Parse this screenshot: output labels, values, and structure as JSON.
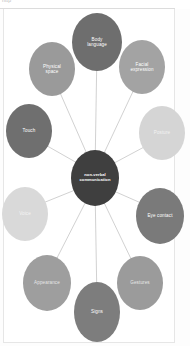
{
  "header": {
    "crumb_text": "http"
  },
  "diagram": {
    "center": {
      "label": "non-verbal\ncommunication",
      "label_line1": "non-verbal",
      "label_line2": "communication",
      "color": "#3f3f3f",
      "text_color": "#ffffff"
    },
    "edge_color": "#bdbdbd",
    "background": "#ffffff",
    "nodes": [
      {
        "id": "body-language",
        "label": "Body\nlanguage",
        "line1": "Body",
        "line2": "language",
        "color": "#6e6e6e",
        "text_color": "#ffffff",
        "cx": 97,
        "cy": 42,
        "rx": 25,
        "ry": 29,
        "angle_deg": 270
      },
      {
        "id": "facial-expression",
        "label": "Facial\nexpression",
        "line1": "Facial",
        "line2": "expression",
        "color": "#a3a3a3",
        "text_color": "#ffffff",
        "cx": 142,
        "cy": 67,
        "rx": 23,
        "ry": 27,
        "angle_deg": 315
      },
      {
        "id": "posture",
        "label": "Posture",
        "line1": "Posture",
        "line2": "",
        "color": "#d5d5d5",
        "text_color": "#f2f2f2",
        "cx": 162,
        "cy": 133,
        "rx": 23,
        "ry": 27,
        "angle_deg": 0
      },
      {
        "id": "eye-contact",
        "label": "Eye contact",
        "line1": "Eye contact",
        "line2": "",
        "color": "#7a7a7a",
        "text_color": "#ffffff",
        "cx": 160,
        "cy": 216,
        "rx": 24,
        "ry": 28,
        "angle_deg": 45
      },
      {
        "id": "gestures",
        "label": "Gestures",
        "line1": "Gestures",
        "line2": "",
        "color": "#9b9b9b",
        "text_color": "#e8e8e8",
        "cx": 140,
        "cy": 283,
        "rx": 23,
        "ry": 27,
        "angle_deg": 70
      },
      {
        "id": "signs",
        "label": "Signs",
        "line1": "Signs",
        "line2": "",
        "color": "#7d7d7d",
        "text_color": "#ffffff",
        "cx": 97,
        "cy": 312,
        "rx": 23,
        "ry": 30,
        "angle_deg": 90
      },
      {
        "id": "appearance",
        "label": "Appearance",
        "line1": "Appearance",
        "line2": "",
        "color": "#9e9e9e",
        "text_color": "#e6e6e6",
        "cx": 47,
        "cy": 283,
        "rx": 24,
        "ry": 28,
        "angle_deg": 115
      },
      {
        "id": "voice",
        "label": "Voice",
        "line1": "Voice",
        "line2": "",
        "color": "#d9d9d9",
        "text_color": "#f4f4f4",
        "cx": 25,
        "cy": 214,
        "rx": 23,
        "ry": 27,
        "angle_deg": 150
      },
      {
        "id": "touch",
        "label": "Touch",
        "line1": "Touch",
        "line2": "",
        "color": "#6f6f6f",
        "text_color": "#ffffff",
        "cx": 29,
        "cy": 131,
        "rx": 23,
        "ry": 27,
        "angle_deg": 190
      },
      {
        "id": "physical-space",
        "label": "Physical\nspace",
        "line1": "Physical",
        "line2": "space",
        "color": "#9a9a9a",
        "text_color": "#ffffff",
        "cx": 52,
        "cy": 69,
        "rx": 23,
        "ry": 27,
        "angle_deg": 225
      }
    ],
    "center_geometry": {
      "cx": 95,
      "cy": 178,
      "rx": 24,
      "ry": 28
    }
  }
}
